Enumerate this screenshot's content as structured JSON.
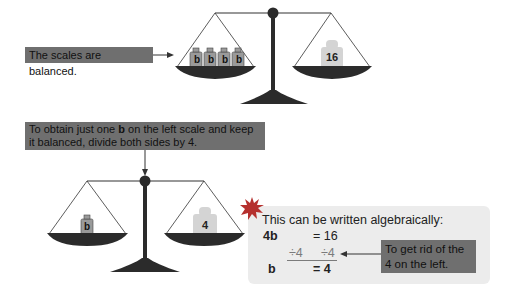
{
  "top_scale": {
    "label": "The scales are balanced.",
    "left_weights": [
      "b",
      "b",
      "b",
      "b"
    ],
    "right_weight": "16"
  },
  "instruction": {
    "text_before": "To obtain just one ",
    "bold": "b",
    "text_after": " on the left scale and keep it balanced, divide both sides by 4."
  },
  "bottom_scale": {
    "left_weight": "b",
    "right_weight": "4"
  },
  "algebra": {
    "heading": "This can be written algebraically:",
    "row1_left": "4b",
    "row1_right": "= 16",
    "row2_left": "÷4",
    "row2_right": "÷4",
    "row3_left": "b",
    "row3_right": "= 4",
    "note": "To get rid of the 4 on the left."
  },
  "colors": {
    "label_bg": "#6f6f6f",
    "box_bg": "#ececec",
    "pan": "#2b2b2b",
    "weight": "#d4d4d4",
    "starburst": "#b5302e",
    "divide_line": "#7b7b7b"
  }
}
